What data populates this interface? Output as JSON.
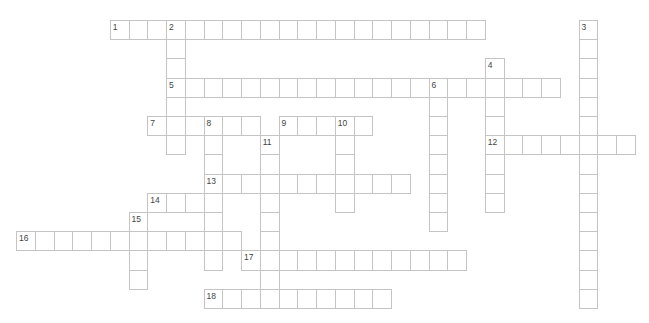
{
  "puzzle": {
    "type": "crossword",
    "grid": {
      "origin_x": 16,
      "origin_y": 20,
      "cell_w": 18.75,
      "cell_h": 19.2
    },
    "colors": {
      "cell_border": "#c4c4c4",
      "cell_fill": "#ffffff",
      "number": "#444444"
    },
    "entries": [
      {
        "number": "1",
        "direction": "across",
        "row": 0,
        "col": 5,
        "length": 20
      },
      {
        "number": "2",
        "direction": "down",
        "row": 0,
        "col": 8,
        "length": 7
      },
      {
        "number": "3",
        "direction": "down",
        "row": 0,
        "col": 30,
        "length": 15
      },
      {
        "number": "4",
        "direction": "down",
        "row": 2,
        "col": 25,
        "length": 8
      },
      {
        "number": "5",
        "direction": "across",
        "row": 3,
        "col": 8,
        "length": 21
      },
      {
        "number": "6",
        "direction": "down",
        "row": 3,
        "col": 22,
        "length": 8
      },
      {
        "number": "7",
        "direction": "across",
        "row": 5,
        "col": 7,
        "length": 6
      },
      {
        "number": "8",
        "direction": "down",
        "row": 5,
        "col": 10,
        "length": 8
      },
      {
        "number": "9",
        "direction": "across",
        "row": 5,
        "col": 14,
        "length": 5
      },
      {
        "number": "10",
        "direction": "down",
        "row": 5,
        "col": 17,
        "length": 5
      },
      {
        "number": "11",
        "direction": "down",
        "row": 6,
        "col": 13,
        "length": 9
      },
      {
        "number": "12",
        "direction": "across",
        "row": 6,
        "col": 25,
        "length": 8
      },
      {
        "number": "13",
        "direction": "across",
        "row": 8,
        "col": 10,
        "length": 11
      },
      {
        "number": "14",
        "direction": "across",
        "row": 9,
        "col": 7,
        "length": 4
      },
      {
        "number": "15",
        "direction": "down",
        "row": 10,
        "col": 6,
        "length": 4
      },
      {
        "number": "16",
        "direction": "across",
        "row": 11,
        "col": 0,
        "length": 12
      },
      {
        "number": "17",
        "direction": "across",
        "row": 12,
        "col": 12,
        "length": 12
      },
      {
        "number": "18",
        "direction": "across",
        "row": 14,
        "col": 10,
        "length": 10
      }
    ]
  }
}
